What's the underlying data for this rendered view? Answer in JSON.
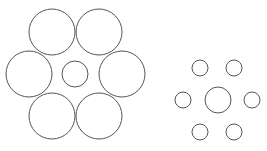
{
  "stroke_color": "#555555",
  "background": "#ffffff",
  "figures": [
    {
      "name": "left-figure",
      "center": {
        "cx": 75,
        "cy": 74,
        "r": 13
      },
      "surround": [
        {
          "cx": 52,
          "cy": 32,
          "r": 23
        },
        {
          "cx": 99,
          "cy": 32,
          "r": 23
        },
        {
          "cx": 29,
          "cy": 74,
          "r": 23
        },
        {
          "cx": 122,
          "cy": 74,
          "r": 23
        },
        {
          "cx": 52,
          "cy": 116,
          "r": 23
        },
        {
          "cx": 99,
          "cy": 116,
          "r": 23
        }
      ]
    },
    {
      "name": "right-figure",
      "center": {
        "cx": 218,
        "cy": 100,
        "r": 13
      },
      "surround": [
        {
          "cx": 200,
          "cy": 68,
          "r": 8
        },
        {
          "cx": 234,
          "cy": 68,
          "r": 8
        },
        {
          "cx": 183,
          "cy": 100,
          "r": 8
        },
        {
          "cx": 252,
          "cy": 100,
          "r": 8
        },
        {
          "cx": 200,
          "cy": 132,
          "r": 8
        },
        {
          "cx": 234,
          "cy": 132,
          "r": 8
        }
      ]
    }
  ]
}
